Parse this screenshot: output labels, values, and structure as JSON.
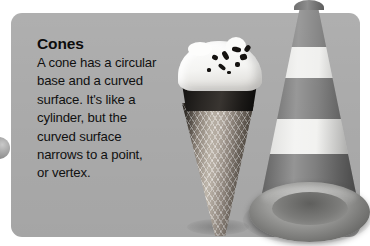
{
  "card": {
    "title": "Cones",
    "body": "A cone has a circular\nbase and a curved\nsurface. It's like a\ncylinder, but the\ncurved surface\nnarrows to a point,\nor vertex.",
    "background_color": "#ababab",
    "text_color": "#101010"
  },
  "images": {
    "ice_cream_cone": {
      "label": "ice-cream-cone",
      "description": "Waffle cone with dark chocolate coating and white ice cream topped with chocolate sprinkles",
      "waffle_color": "#8a8178",
      "chocolate_color": "#1b1917",
      "ice_cream_color": "#ffffff"
    },
    "traffic_cone": {
      "label": "traffic-cone",
      "description": "Traffic cone with alternating gray and white reflective bands on a wide elliptical base",
      "band_gray": "#7e7e7e",
      "band_white": "#efefed",
      "base_color": "#9b9b99"
    },
    "edge_circle": {
      "label": "partial-circle",
      "description": "Partially visible gray circular object at the left edge"
    }
  },
  "page": {
    "background_color": "#ffffff"
  }
}
